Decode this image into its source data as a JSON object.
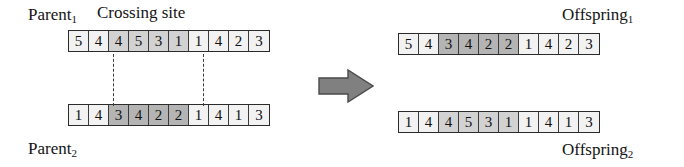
{
  "figure": {
    "type": "two-point-crossover-diagram",
    "labels": {
      "parent1": "Parent",
      "parent1_sub": "1",
      "parent2": "Parent",
      "parent2_sub": "2",
      "crossing_site": "Crossing site",
      "offspring1": "Offspring",
      "offspring1_sub": "1",
      "offspring2": "Offspring",
      "offspring2_sub": "2"
    },
    "colors": {
      "cell_light": "#f2f2f2",
      "cell_mid": "#d2d2d2",
      "cell_dark": "#b4b4b4",
      "border": "#2b2b2b",
      "arrow_fill": "#808080",
      "arrow_stroke": "#4a4a4a",
      "text": "#141414"
    },
    "crossing_points": [
      2,
      6
    ],
    "chromosomes": {
      "parent1": {
        "name": "Parent 1",
        "genes": [
          "5",
          "4",
          "4",
          "5",
          "3",
          "1",
          "1",
          "4",
          "2",
          "3"
        ],
        "shading": [
          "light",
          "light",
          "mid",
          "mid",
          "mid",
          "mid",
          "light",
          "light",
          "light",
          "light"
        ]
      },
      "parent2": {
        "name": "Parent 2",
        "genes": [
          "1",
          "4",
          "3",
          "4",
          "2",
          "2",
          "1",
          "4",
          "1",
          "3"
        ],
        "shading": [
          "light",
          "light",
          "dark",
          "dark",
          "dark",
          "dark",
          "light",
          "light",
          "light",
          "light"
        ]
      },
      "offspring1": {
        "name": "Offspring 1",
        "genes": [
          "5",
          "4",
          "3",
          "4",
          "2",
          "2",
          "1",
          "4",
          "2",
          "3"
        ],
        "shading": [
          "light",
          "light",
          "dark",
          "dark",
          "dark",
          "dark",
          "light",
          "light",
          "light",
          "light"
        ]
      },
      "offspring2": {
        "name": "Offspring 2",
        "genes": [
          "1",
          "4",
          "4",
          "5",
          "3",
          "1",
          "1",
          "4",
          "1",
          "3"
        ],
        "shading": [
          "light",
          "light",
          "mid",
          "mid",
          "mid",
          "mid",
          "light",
          "light",
          "light",
          "light"
        ]
      }
    },
    "arrow": {
      "direction": "right",
      "name": "transformation-arrow"
    }
  }
}
